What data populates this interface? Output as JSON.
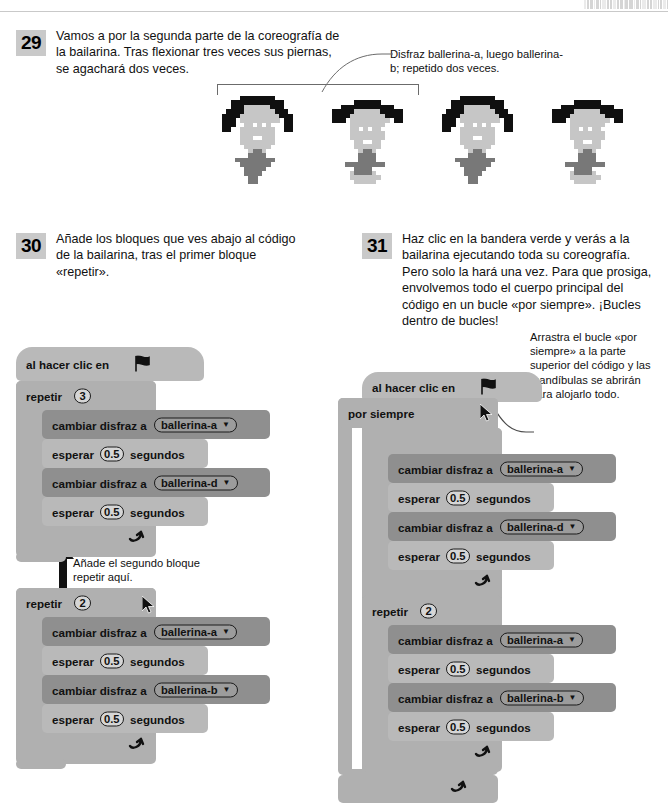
{
  "page": {
    "barcode_bars": [
      3,
      2,
      5,
      1,
      4,
      2,
      6,
      2,
      3,
      5,
      2,
      4,
      1,
      3,
      6,
      2,
      4,
      2,
      5,
      3,
      2,
      6,
      1,
      4,
      3,
      2
    ]
  },
  "steps": [
    {
      "number": "29",
      "text": "Vamos a por la segunda parte de la coreografía de la bailarina. Tras flexionar tres veces sus piernas, se agachará dos veces."
    },
    {
      "number": "30",
      "text": "Añade los bloques que ves abajo al código de la bailarina, tras el primer bloque «repetir»."
    },
    {
      "number": "31",
      "text": "Haz clic en la bandera verde y verás a la bailarina ejecutando toda su coreografía. Pero solo la hará una vez. Para que prosiga, envolvemos todo el cuerpo principal del código en un bucle «por siempre». ¡Bucles dentro de bucles!"
    }
  ],
  "callouts": {
    "costume": "Disfraz ballerina-a, luego ballerina-b; repetido dos veces.",
    "drag_loop": "Arrastra el bucle «por siempre» a la parte superior del código y las mandíbulas se abrirán para alojarlo todo.",
    "add_repeat": "Añade el segundo bloque repetir aquí."
  },
  "blocks": {
    "when_flag": "al hacer clic en",
    "repeat": "repetir",
    "forever": "por siempre",
    "switch_costume": "cambiar disfraz a",
    "wait": "esperar",
    "seconds": "segundos",
    "loop_arrow": "↴"
  },
  "left_script": {
    "hat": "al hacer clic en",
    "repeat_label": "repetir",
    "repeat_count": "3",
    "body": [
      {
        "kind": "looks",
        "label": "cambiar disfraz a",
        "value": "ballerina-a"
      },
      {
        "kind": "wait",
        "label": "esperar",
        "value": "0.5",
        "suffix": "segundos"
      },
      {
        "kind": "looks",
        "label": "cambiar disfraz a",
        "value": "ballerina-d"
      },
      {
        "kind": "wait",
        "label": "esperar",
        "value": "0.5",
        "suffix": "segundos"
      }
    ]
  },
  "left_script_2": {
    "repeat_label": "repetir",
    "repeat_count": "2",
    "body": [
      {
        "kind": "looks",
        "label": "cambiar disfraz a",
        "value": "ballerina-a"
      },
      {
        "kind": "wait",
        "label": "esperar",
        "value": "0.5",
        "suffix": "segundos"
      },
      {
        "kind": "looks",
        "label": "cambiar disfraz a",
        "value": "ballerina-b"
      },
      {
        "kind": "wait",
        "label": "esperar",
        "value": "0.5",
        "suffix": "segundos"
      }
    ]
  },
  "right_script": {
    "hat": "al hacer clic en",
    "forever_label": "por siempre",
    "inner_repeat_1_label": "",
    "inner_repeat_1_count": "",
    "body_1": [
      {
        "kind": "looks",
        "label": "cambiar disfraz a",
        "value": "ballerina-a"
      },
      {
        "kind": "wait",
        "label": "esperar",
        "value": "0.5",
        "suffix": "segundos"
      },
      {
        "kind": "looks",
        "label": "cambiar disfraz a",
        "value": "ballerina-d"
      },
      {
        "kind": "wait",
        "label": "esperar",
        "value": "0.5",
        "suffix": "segundos"
      }
    ],
    "inner_repeat_2_label": "repetir",
    "inner_repeat_2_count": "2",
    "body_2": [
      {
        "kind": "looks",
        "label": "cambiar disfraz a",
        "value": "ballerina-a"
      },
      {
        "kind": "wait",
        "label": "esperar",
        "value": "0.5",
        "suffix": "segundos"
      },
      {
        "kind": "looks",
        "label": "cambiar disfraz a",
        "value": "ballerina-b"
      },
      {
        "kind": "wait",
        "label": "esperar",
        "value": "0.5",
        "suffix": "segundos"
      }
    ]
  },
  "sprites": {
    "count": 4,
    "labels": [
      "ballerina-a",
      "ballerina-b",
      "ballerina-a",
      "ballerina-b"
    ]
  },
  "colors": {
    "block_control": "#b0b0b0",
    "block_control_light": "#b9b9b9",
    "block_looks": "#8f8f8f",
    "step_badge": "#c9c9c9",
    "text": "#111111",
    "rule": "#c9c9c9"
  }
}
